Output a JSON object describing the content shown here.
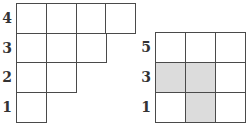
{
  "left_figure": {
    "rows": [
      {
        "label": "4",
        "cells": 4
      },
      {
        "label": "3",
        "cells": 3
      },
      {
        "label": "2",
        "cells": 2
      },
      {
        "label": "1",
        "cells": 1
      }
    ]
  },
  "right_figure": {
    "rows": [
      {
        "label": "5",
        "shaded": [
          false,
          false,
          false
        ]
      },
      {
        "label": "3",
        "shaded": [
          true,
          true,
          false
        ]
      },
      {
        "label": "1",
        "shaded": [
          false,
          true,
          false
        ]
      }
    ]
  },
  "colors": {
    "border": "#4a4a4a",
    "shade": "#dcdcdc",
    "label": "#333333"
  }
}
